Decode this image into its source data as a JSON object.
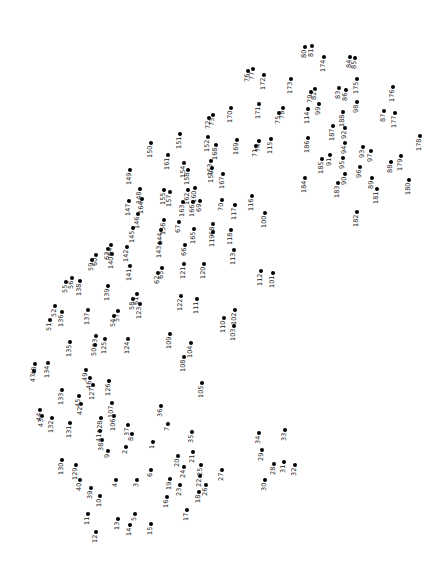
{
  "puzzle": {
    "type": "connect-the-dots",
    "dot_color": "#000000",
    "label_color": "#222222",
    "points": [
      {
        "n": "1",
        "x": 153,
        "y": 442
      },
      {
        "n": "2",
        "x": 126,
        "y": 447
      },
      {
        "n": "3",
        "x": 137,
        "y": 480
      },
      {
        "n": "4",
        "x": 116,
        "y": 480
      },
      {
        "n": "5",
        "x": 135,
        "y": 514
      },
      {
        "n": "6",
        "x": 151,
        "y": 470
      },
      {
        "n": "7",
        "x": 168,
        "y": 424
      },
      {
        "n": "8",
        "x": 132,
        "y": 434
      },
      {
        "n": "9",
        "x": 108,
        "y": 451
      },
      {
        "n": "10",
        "x": 100,
        "y": 496
      },
      {
        "n": "11",
        "x": 88,
        "y": 514
      },
      {
        "n": "12",
        "x": 96,
        "y": 532
      },
      {
        "n": "13",
        "x": 118,
        "y": 519
      },
      {
        "n": "14",
        "x": 130,
        "y": 525
      },
      {
        "n": "15",
        "x": 151,
        "y": 524
      },
      {
        "n": "16",
        "x": 167,
        "y": 497
      },
      {
        "n": "17",
        "x": 187,
        "y": 510
      },
      {
        "n": "18",
        "x": 199,
        "y": 492
      },
      {
        "n": "19",
        "x": 170,
        "y": 479
      },
      {
        "n": "20",
        "x": 178,
        "y": 456
      },
      {
        "n": "21",
        "x": 193,
        "y": 452
      },
      {
        "n": "22",
        "x": 200,
        "y": 476
      },
      {
        "n": "23",
        "x": 180,
        "y": 485
      },
      {
        "n": "24",
        "x": 184,
        "y": 467
      },
      {
        "n": "25",
        "x": 201,
        "y": 465
      },
      {
        "n": "26",
        "x": 206,
        "y": 485
      },
      {
        "n": "27",
        "x": 222,
        "y": 470
      },
      {
        "n": "28",
        "x": 274,
        "y": 464
      },
      {
        "n": "29",
        "x": 262,
        "y": 450
      },
      {
        "n": "30",
        "x": 265,
        "y": 480
      },
      {
        "n": "31",
        "x": 284,
        "y": 462
      },
      {
        "n": "32",
        "x": 295,
        "y": 465
      },
      {
        "n": "33",
        "x": 285,
        "y": 430
      },
      {
        "n": "34",
        "x": 259,
        "y": 433
      },
      {
        "n": "35",
        "x": 192,
        "y": 432
      },
      {
        "n": "36",
        "x": 161,
        "y": 406
      },
      {
        "n": "37",
        "x": 128,
        "y": 425
      },
      {
        "n": "38",
        "x": 102,
        "y": 440
      },
      {
        "n": "39",
        "x": 91,
        "y": 488
      },
      {
        "n": "40",
        "x": 80,
        "y": 480
      },
      {
        "n": "41",
        "x": 100,
        "y": 431
      },
      {
        "n": "42",
        "x": 81,
        "y": 404
      },
      {
        "n": "43",
        "x": 42,
        "y": 416
      },
      {
        "n": "44",
        "x": 40,
        "y": 410
      },
      {
        "n": "45",
        "x": 79,
        "y": 396
      },
      {
        "n": "46",
        "x": 90,
        "y": 378
      },
      {
        "n": "47",
        "x": 34,
        "y": 371
      },
      {
        "n": "48",
        "x": 35,
        "y": 364
      },
      {
        "n": "49",
        "x": 86,
        "y": 370
      },
      {
        "n": "50",
        "x": 95,
        "y": 345
      },
      {
        "n": "51",
        "x": 50,
        "y": 320
      },
      {
        "n": "52",
        "x": 55,
        "y": 306
      },
      {
        "n": "53",
        "x": 96,
        "y": 336
      },
      {
        "n": "54",
        "x": 114,
        "y": 316
      },
      {
        "n": "55",
        "x": 66,
        "y": 282
      },
      {
        "n": "56",
        "x": 72,
        "y": 278
      },
      {
        "n": "57",
        "x": 118,
        "y": 311
      },
      {
        "n": "58",
        "x": 133,
        "y": 299
      },
      {
        "n": "59",
        "x": 92,
        "y": 260
      },
      {
        "n": "60",
        "x": 96,
        "y": 255
      },
      {
        "n": "61",
        "x": 137,
        "y": 294
      },
      {
        "n": "62",
        "x": 158,
        "y": 273
      },
      {
        "n": "63",
        "x": 108,
        "y": 249
      },
      {
        "n": "64",
        "x": 111,
        "y": 245
      },
      {
        "n": "65",
        "x": 162,
        "y": 268
      },
      {
        "n": "66",
        "x": 185,
        "y": 245
      },
      {
        "n": "67",
        "x": 179,
        "y": 222
      },
      {
        "n": "68",
        "x": 213,
        "y": 224
      },
      {
        "n": "69",
        "x": 200,
        "y": 201
      },
      {
        "n": "70",
        "x": 222,
        "y": 200
      },
      {
        "n": "71",
        "x": 256,
        "y": 146
      },
      {
        "n": "72",
        "x": 209,
        "y": 118
      },
      {
        "n": "73",
        "x": 213,
        "y": 115
      },
      {
        "n": "74",
        "x": 259,
        "y": 141
      },
      {
        "n": "75",
        "x": 279,
        "y": 113
      },
      {
        "n": "76",
        "x": 248,
        "y": 71
      },
      {
        "n": "77",
        "x": 253,
        "y": 69
      },
      {
        "n": "78",
        "x": 283,
        "y": 108
      },
      {
        "n": "79",
        "x": 311,
        "y": 92
      },
      {
        "n": "80",
        "x": 305,
        "y": 47
      },
      {
        "n": "81",
        "x": 312,
        "y": 46
      },
      {
        "n": "82",
        "x": 315,
        "y": 89
      },
      {
        "n": "83",
        "x": 339,
        "y": 88
      },
      {
        "n": "84",
        "x": 350,
        "y": 57
      },
      {
        "n": "85",
        "x": 355,
        "y": 58
      },
      {
        "n": "86",
        "x": 346,
        "y": 90
      },
      {
        "n": "87",
        "x": 384,
        "y": 111
      },
      {
        "n": "88",
        "x": 391,
        "y": 162
      },
      {
        "n": "89",
        "x": 372,
        "y": 178
      },
      {
        "n": "90",
        "x": 345,
        "y": 174
      },
      {
        "n": "91",
        "x": 330,
        "y": 155
      },
      {
        "n": "92",
        "x": 345,
        "y": 128
      },
      {
        "n": "93",
        "x": 363,
        "y": 147
      },
      {
        "n": "94",
        "x": 345,
        "y": 143
      },
      {
        "n": "95",
        "x": 343,
        "y": 158
      },
      {
        "n": "96",
        "x": 360,
        "y": 167
      },
      {
        "n": "97",
        "x": 371,
        "y": 151
      },
      {
        "n": "98",
        "x": 357,
        "y": 102
      },
      {
        "n": "99",
        "x": 319,
        "y": 104
      },
      {
        "n": "100",
        "x": 265,
        "y": 213
      },
      {
        "n": "101",
        "x": 273,
        "y": 273
      },
      {
        "n": "102",
        "x": 235,
        "y": 310
      },
      {
        "n": "103",
        "x": 234,
        "y": 326
      },
      {
        "n": "104",
        "x": 191,
        "y": 343
      },
      {
        "n": "105",
        "x": 202,
        "y": 383
      },
      {
        "n": "106",
        "x": 114,
        "y": 416
      },
      {
        "n": "107",
        "x": 112,
        "y": 403
      },
      {
        "n": "108",
        "x": 184,
        "y": 357
      },
      {
        "n": "109",
        "x": 170,
        "y": 334
      },
      {
        "n": "110",
        "x": 224,
        "y": 318
      },
      {
        "n": "111",
        "x": 197,
        "y": 299
      },
      {
        "n": "112",
        "x": 261,
        "y": 271
      },
      {
        "n": "113",
        "x": 234,
        "y": 250
      },
      {
        "n": "114",
        "x": 308,
        "y": 109
      },
      {
        "n": "115",
        "x": 271,
        "y": 139
      },
      {
        "n": "116",
        "x": 252,
        "y": 196
      },
      {
        "n": "117",
        "x": 235,
        "y": 205
      },
      {
        "n": "118",
        "x": 231,
        "y": 230
      },
      {
        "n": "119",
        "x": 213,
        "y": 232
      },
      {
        "n": "120",
        "x": 204,
        "y": 264
      },
      {
        "n": "121",
        "x": 184,
        "y": 264
      },
      {
        "n": "122",
        "x": 181,
        "y": 296
      },
      {
        "n": "123",
        "x": 140,
        "y": 304
      },
      {
        "n": "124",
        "x": 128,
        "y": 339
      },
      {
        "n": "125",
        "x": 105,
        "y": 339
      },
      {
        "n": "126",
        "x": 109,
        "y": 381
      },
      {
        "n": "127",
        "x": 93,
        "y": 385
      },
      {
        "n": "128",
        "x": 101,
        "y": 418
      },
      {
        "n": "129",
        "x": 76,
        "y": 465
      },
      {
        "n": "130",
        "x": 62,
        "y": 460
      },
      {
        "n": "131",
        "x": 70,
        "y": 423
      },
      {
        "n": "132",
        "x": 52,
        "y": 418
      },
      {
        "n": "133",
        "x": 62,
        "y": 390
      },
      {
        "n": "134",
        "x": 48,
        "y": 363
      },
      {
        "n": "135",
        "x": 70,
        "y": 342
      },
      {
        "n": "136",
        "x": 62,
        "y": 312
      },
      {
        "n": "137",
        "x": 88,
        "y": 310
      },
      {
        "n": "138",
        "x": 80,
        "y": 281
      },
      {
        "n": "139",
        "x": 108,
        "y": 286
      },
      {
        "n": "140",
        "x": 112,
        "y": 254
      },
      {
        "n": "141",
        "x": 130,
        "y": 266
      },
      {
        "n": "142",
        "x": 127,
        "y": 247
      },
      {
        "n": "143",
        "x": 160,
        "y": 243
      },
      {
        "n": "144",
        "x": 161,
        "y": 230
      },
      {
        "n": "145",
        "x": 133,
        "y": 228
      },
      {
        "n": "146",
        "x": 138,
        "y": 214
      },
      {
        "n": "147",
        "x": 129,
        "y": 201
      },
      {
        "n": "148",
        "x": 140,
        "y": 189
      },
      {
        "n": "149",
        "x": 130,
        "y": 170
      },
      {
        "n": "150",
        "x": 151,
        "y": 143
      },
      {
        "n": "151",
        "x": 180,
        "y": 134
      },
      {
        "n": "152",
        "x": 208,
        "y": 137
      },
      {
        "n": "153",
        "x": 211,
        "y": 161
      },
      {
        "n": "154",
        "x": 184,
        "y": 163
      },
      {
        "n": "155",
        "x": 164,
        "y": 190
      },
      {
        "n": "156",
        "x": 164,
        "y": 220
      },
      {
        "n": "157",
        "x": 170,
        "y": 192
      },
      {
        "n": "158",
        "x": 188,
        "y": 170
      },
      {
        "n": "159",
        "x": 212,
        "y": 168
      },
      {
        "n": "160",
        "x": 195,
        "y": 188
      },
      {
        "n": "161",
        "x": 168,
        "y": 155
      },
      {
        "n": "162",
        "x": 188,
        "y": 190
      },
      {
        "n": "163",
        "x": 183,
        "y": 202
      },
      {
        "n": "164",
        "x": 142,
        "y": 199
      },
      {
        "n": "165",
        "x": 194,
        "y": 229
      },
      {
        "n": "166",
        "x": 193,
        "y": 202
      },
      {
        "n": "167",
        "x": 223,
        "y": 174
      },
      {
        "n": "168",
        "x": 216,
        "y": 145
      },
      {
        "n": "169",
        "x": 237,
        "y": 140
      },
      {
        "n": "170",
        "x": 231,
        "y": 108
      },
      {
        "n": "171",
        "x": 259,
        "y": 104
      },
      {
        "n": "172",
        "x": 264,
        "y": 75
      },
      {
        "n": "173",
        "x": 291,
        "y": 79
      },
      {
        "n": "174",
        "x": 324,
        "y": 57
      },
      {
        "n": "175",
        "x": 357,
        "y": 79
      },
      {
        "n": "176",
        "x": 393,
        "y": 87
      },
      {
        "n": "177",
        "x": 395,
        "y": 113
      },
      {
        "n": "178",
        "x": 420,
        "y": 136
      },
      {
        "n": "179",
        "x": 401,
        "y": 156
      },
      {
        "n": "180",
        "x": 409,
        "y": 180
      },
      {
        "n": "181",
        "x": 377,
        "y": 189
      },
      {
        "n": "182",
        "x": 357,
        "y": 212
      },
      {
        "n": "183",
        "x": 338,
        "y": 183
      },
      {
        "n": "184",
        "x": 305,
        "y": 178
      },
      {
        "n": "185",
        "x": 322,
        "y": 159
      },
      {
        "n": "186",
        "x": 308,
        "y": 138
      },
      {
        "n": "187",
        "x": 333,
        "y": 126
      },
      {
        "n": "188",
        "x": 343,
        "y": 112
      }
    ]
  }
}
